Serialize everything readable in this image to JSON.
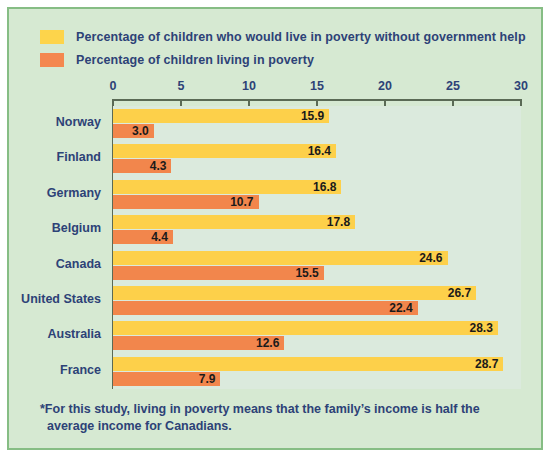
{
  "legend": {
    "items": [
      {
        "swatch": "yellow-swatch",
        "color": "#fdd44b",
        "label": "Percentage of children who would live in poverty without government help"
      },
      {
        "swatch": "orange-swatch",
        "color": "#f4874f",
        "label": "Percentage of children living in poverty"
      }
    ]
  },
  "footnote": {
    "line1": "*For this study, living in poverty means that the family’s income is half the",
    "line2": "average income for Canadians."
  },
  "colors": {
    "card_background": "#d6e9d2",
    "plot_background": "#dbeadd",
    "card_border": "#86bd84",
    "text": "#2d4277",
    "series_without_help": "#fdd04a",
    "series_in_poverty": "#f2864c",
    "axis": "#5a6a55"
  },
  "chart_data": {
    "type": "bar",
    "orientation": "horizontal",
    "title": "",
    "subtitle": "",
    "xlabel": "",
    "ylabel": "",
    "xlim": [
      0,
      30
    ],
    "xticks": [
      0,
      5,
      10,
      15,
      20,
      25,
      30
    ],
    "xtick_labels": [
      "0",
      "5",
      "10",
      "15",
      "20",
      "25",
      "30"
    ],
    "grid": false,
    "legend_position": "top-left",
    "categories": [
      "Norway",
      "Finland",
      "Germany",
      "Belgium",
      "Canada",
      "United States",
      "Australia",
      "France"
    ],
    "series": [
      {
        "name": "Percentage of children who would live in poverty without government help",
        "color": "#fdd04a",
        "values": [
          15.9,
          16.4,
          16.8,
          17.8,
          24.6,
          26.7,
          28.3,
          28.7
        ],
        "labels": [
          "15.9",
          "16.4",
          "16.8",
          "17.8",
          "24.6",
          "26.7",
          "28.3",
          "28.7"
        ]
      },
      {
        "name": "Percentage of children living in poverty",
        "color": "#f2864c",
        "values": [
          3.0,
          4.3,
          10.7,
          4.4,
          15.5,
          22.4,
          12.6,
          7.9
        ],
        "labels": [
          "3.0",
          "4.3",
          "10.7",
          "4.4",
          "15.5",
          "22.4",
          "12.6",
          "7.9"
        ]
      }
    ]
  }
}
